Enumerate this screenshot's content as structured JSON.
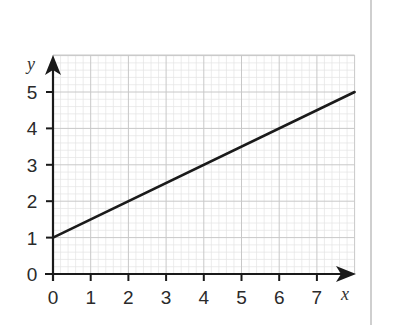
{
  "chart_data": {
    "type": "line",
    "title": "",
    "xlabel": "x",
    "ylabel": "y",
    "xlim": [
      0,
      8
    ],
    "ylim": [
      0,
      6
    ],
    "x_ticks": [
      0,
      1,
      2,
      3,
      4,
      5,
      6,
      7
    ],
    "y_ticks": [
      0,
      1,
      2,
      3,
      4,
      5
    ],
    "grid": true,
    "minor_grid_per_unit": 5,
    "series": [
      {
        "name": "y = 0.5x + 1",
        "x": [
          0,
          8
        ],
        "y": [
          1,
          5
        ],
        "color": "#1a1a1a"
      }
    ]
  },
  "colors": {
    "axis": "#1a1a1a",
    "major_grid": "#c8c8c8",
    "minor_grid": "#e4e4e4",
    "divider": "#cfcfcf"
  }
}
